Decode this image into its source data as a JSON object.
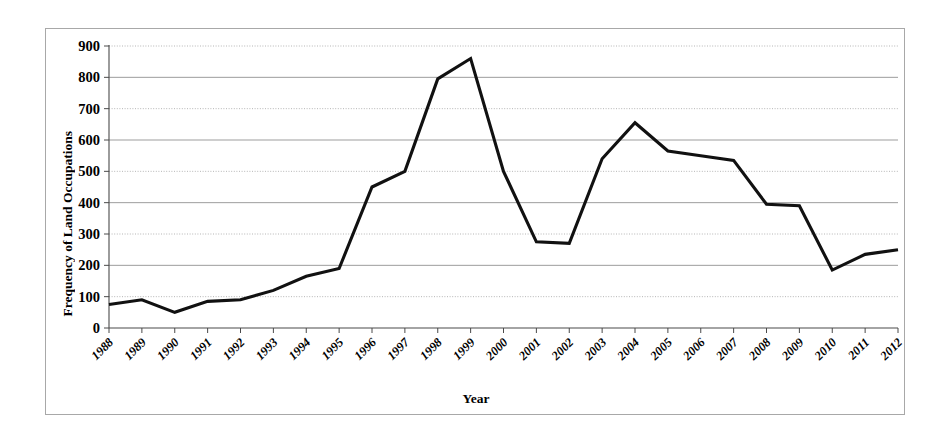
{
  "chart_data": {
    "type": "line",
    "title": "",
    "xlabel": "Year",
    "ylabel": "Frequency of Land Occupations",
    "categories": [
      "1988",
      "1989",
      "1990",
      "1991",
      "1992",
      "1993",
      "1994",
      "1995",
      "1996",
      "1997",
      "1998",
      "1999",
      "2000",
      "2001",
      "2002",
      "2003",
      "2004",
      "2005",
      "2006",
      "2007",
      "2008",
      "2009",
      "2010",
      "2011",
      "2012"
    ],
    "values": [
      75,
      90,
      50,
      85,
      90,
      120,
      165,
      190,
      450,
      500,
      795,
      860,
      500,
      275,
      270,
      540,
      655,
      565,
      550,
      535,
      395,
      390,
      185,
      235,
      250
    ],
    "series": [
      {
        "name": "Land Occupations",
        "values": [
          75,
          90,
          50,
          85,
          90,
          120,
          165,
          190,
          450,
          500,
          795,
          860,
          500,
          275,
          270,
          540,
          655,
          565,
          550,
          535,
          395,
          390,
          185,
          235,
          250
        ],
        "color": "#111111"
      }
    ],
    "ylim": [
      0,
      900
    ],
    "ytick_labels": [
      "0",
      "100",
      "200",
      "300",
      "400",
      "500",
      "600",
      "700",
      "800",
      "900"
    ],
    "ytick_values": [
      0,
      100,
      200,
      300,
      400,
      500,
      600,
      700,
      800,
      900
    ],
    "grid": true,
    "grid_axis": "y",
    "legend": false,
    "legend_position": "none",
    "line_color": "#111111",
    "grid_color_solid": "#9d9d9d",
    "grid_color_dotted": "#b5b5b5",
    "axis_color": "#4a4a4a",
    "frame_border_color": "#a8a8a8",
    "background_color": "#ffffff",
    "xtick_label_rotation": -45
  }
}
